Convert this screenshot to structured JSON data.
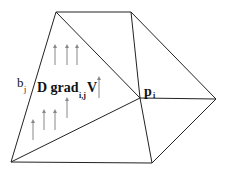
{
  "diagram": {
    "labels": {
      "b": "b",
      "b_sub": "j",
      "grad_main": "D grad",
      "grad_sub": "i,j",
      "grad_tail": "V",
      "p": "p",
      "p_sub": "i"
    },
    "colors": {
      "edge": "#222222",
      "arrow": "#888888",
      "background": "#ffffff"
    },
    "vertices": {
      "top_left": [
        56,
        12
      ],
      "top_right": [
        131,
        12
      ],
      "right": [
        216,
        99
      ],
      "bottom_right": [
        152,
        163
      ],
      "bottom_left": [
        11,
        162
      ],
      "p_i": [
        140,
        98
      ]
    },
    "arrows": [
      {
        "x": 55,
        "y1": 65,
        "y2": 45
      },
      {
        "x": 67,
        "y1": 65,
        "y2": 45
      },
      {
        "x": 77,
        "y1": 65,
        "y2": 45
      },
      {
        "x": 99,
        "y1": 98,
        "y2": 77
      },
      {
        "x": 67,
        "y1": 118,
        "y2": 98
      },
      {
        "x": 33,
        "y1": 140,
        "y2": 120
      },
      {
        "x": 44,
        "y1": 130,
        "y2": 110
      },
      {
        "x": 55,
        "y1": 130,
        "y2": 110
      }
    ]
  }
}
